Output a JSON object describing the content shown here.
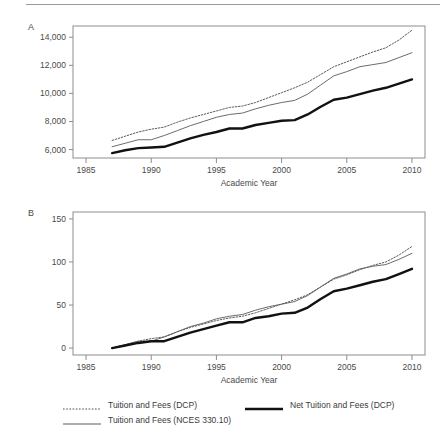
{
  "figure": {
    "panels": [
      {
        "letter": "A",
        "xlabel": "Academic Year",
        "ylabel": "",
        "yticks": [
          "6,000",
          "8,000",
          "10,000",
          "12,000",
          "14,000"
        ],
        "xticks": [
          "1985",
          "1990",
          "1995",
          "2000",
          "2005",
          "2010"
        ]
      },
      {
        "letter": "B",
        "xlabel": "Academic Year",
        "ylabel": "",
        "yticks": [
          "0",
          "50",
          "100",
          "150"
        ],
        "xticks": [
          "1985",
          "1990",
          "1995",
          "2000",
          "2005",
          "2010"
        ]
      }
    ]
  },
  "legend": {
    "entries": [
      {
        "label": "Tuition and Fees (DCP)",
        "style": "dotted",
        "color": "#4a4a4a",
        "width": 1
      },
      {
        "label": "Net Tuition and Fees (DCP)",
        "style": "solid",
        "color": "#111111",
        "width": 2.6
      },
      {
        "label": "Tuition and Fees (NCES 330.10)",
        "style": "solid",
        "color": "#5a5a5a",
        "width": 1
      }
    ]
  },
  "chart_data": [
    {
      "type": "line",
      "panel": "A",
      "title": "",
      "xlabel": "Academic Year",
      "ylabel": "",
      "xlim": [
        1984,
        2011
      ],
      "ylim": [
        5400,
        14800
      ],
      "xticks": [
        1985,
        1990,
        1995,
        2000,
        2005,
        2010
      ],
      "yticks": [
        6000,
        8000,
        10000,
        12000,
        14000
      ],
      "grid": false,
      "legend_position": "below-figure",
      "x": [
        1987,
        1988,
        1989,
        1990,
        1991,
        1992,
        1993,
        1994,
        1995,
        1996,
        1997,
        1998,
        1999,
        2000,
        2001,
        2002,
        2003,
        2004,
        2005,
        2006,
        2007,
        2008,
        2009,
        2010
      ],
      "series": [
        {
          "name": "Tuition and Fees (DCP)",
          "style": "dotted",
          "color": "#4a4a4a",
          "values": [
            6650,
            6950,
            7250,
            7450,
            7600,
            7950,
            8250,
            8500,
            8750,
            9000,
            9100,
            9350,
            9700,
            10050,
            10400,
            10800,
            11350,
            11900,
            12250,
            12600,
            12950,
            13250,
            13800,
            14500
          ]
        },
        {
          "name": "Tuition and Fees (NCES 330.10)",
          "style": "solid",
          "color": "#5a5a5a",
          "values": [
            6200,
            6450,
            6700,
            6700,
            7000,
            7350,
            7700,
            8000,
            8300,
            8500,
            8600,
            8900,
            9150,
            9350,
            9500,
            9950,
            10600,
            11250,
            11550,
            11900,
            12050,
            12200,
            12550,
            12900
          ]
        },
        {
          "name": "Net Tuition and Fees (DCP)",
          "style": "solid",
          "color": "#111111",
          "values": [
            5750,
            5950,
            6100,
            6150,
            6200,
            6500,
            6800,
            7050,
            7250,
            7500,
            7500,
            7750,
            7900,
            8050,
            8100,
            8500,
            9050,
            9550,
            9700,
            9950,
            10200,
            10400,
            10700,
            11000
          ]
        }
      ]
    },
    {
      "type": "line",
      "panel": "B",
      "title": "",
      "xlabel": "Academic Year",
      "ylabel": "",
      "xlim": [
        1984,
        2011
      ],
      "ylim": [
        -8,
        158
      ],
      "xticks": [
        1985,
        1990,
        1995,
        2000,
        2005,
        2010
      ],
      "yticks": [
        0,
        50,
        100,
        150
      ],
      "grid": false,
      "legend_position": "below-figure",
      "x": [
        1987,
        1988,
        1989,
        1990,
        1991,
        1992,
        1993,
        1994,
        1995,
        1996,
        1997,
        1998,
        1999,
        2000,
        2001,
        2002,
        2003,
        2004,
        2005,
        2006,
        2007,
        2008,
        2009,
        2010
      ],
      "series": [
        {
          "name": "Tuition and Fees (DCP)",
          "style": "dotted",
          "color": "#4a4a4a",
          "values": [
            0,
            4,
            8,
            11,
            13,
            19,
            24,
            28,
            32,
            35,
            37,
            41,
            46,
            51,
            56,
            62,
            71,
            80,
            85,
            91,
            96,
            100,
            108,
            118
          ]
        },
        {
          "name": "Tuition and Fees (NCES 330.10)",
          "style": "solid",
          "color": "#5a5a5a",
          "values": [
            0,
            4,
            8,
            8,
            13,
            19,
            25,
            29,
            34,
            37,
            39,
            44,
            48,
            51,
            54,
            61,
            71,
            81,
            86,
            92,
            95,
            97,
            103,
            110
          ]
        },
        {
          "name": "Net Tuition and Fees (DCP)",
          "style": "solid",
          "color": "#111111",
          "values": [
            0,
            3,
            6,
            8,
            8,
            13,
            18,
            22,
            26,
            30,
            30,
            35,
            37,
            40,
            41,
            47,
            57,
            66,
            69,
            73,
            77,
            80,
            86,
            92
          ]
        }
      ]
    }
  ]
}
